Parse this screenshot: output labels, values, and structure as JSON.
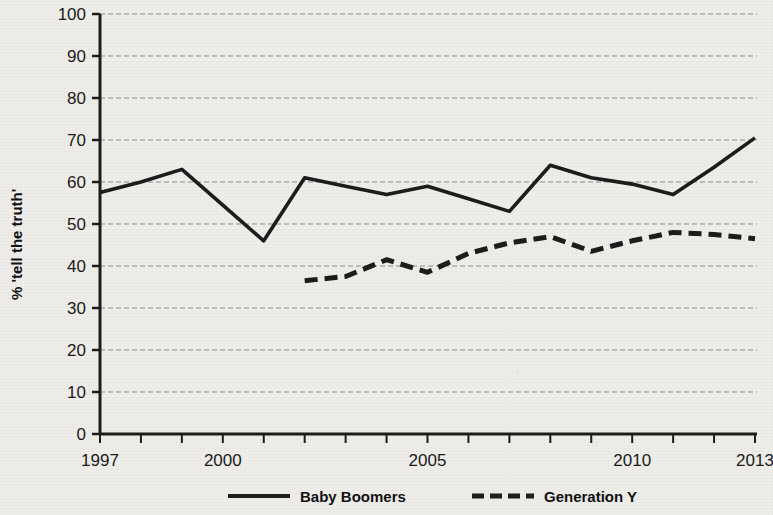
{
  "chart_data": {
    "type": "line",
    "title": "",
    "subtitle": "",
    "xlabel": "",
    "ylabel": "% 'tell the truth'",
    "xlim": [
      1997,
      2013
    ],
    "ylim": [
      0,
      100
    ],
    "ytick_values": [
      0,
      10,
      20,
      30,
      40,
      50,
      60,
      70,
      80,
      90,
      100
    ],
    "ytick_labels": [
      "0",
      "10",
      "20",
      "30",
      "40",
      "50",
      "60",
      "70",
      "80",
      "90",
      "100"
    ],
    "xtick_values": [
      1997,
      1998,
      1999,
      2000,
      2001,
      2002,
      2003,
      2004,
      2005,
      2006,
      2007,
      2008,
      2009,
      2010,
      2011,
      2012,
      2013
    ],
    "xtick_labels_shown": [
      "1997",
      "2000",
      "2005",
      "2010",
      "2013"
    ],
    "xtick_labeled_values": [
      1997,
      2000,
      2005,
      2010,
      2013
    ],
    "grid": "horizontal-dashed",
    "legend_position": "bottom",
    "series": [
      {
        "name": "Baby Boomers",
        "style": "solid",
        "color": "#1c1c1c",
        "x": [
          1997,
          1998,
          1999,
          2000,
          2001,
          2002,
          2003,
          2004,
          2005,
          2006,
          2007,
          2008,
          2009,
          2010,
          2011,
          2012,
          2013
        ],
        "values": [
          57.5,
          60,
          63,
          54.5,
          46,
          61,
          59,
          57,
          59,
          56,
          53,
          64,
          61,
          59.5,
          57,
          63.5,
          70.5
        ]
      },
      {
        "name": "Generation Y",
        "style": "dashed",
        "color": "#1c1c1c",
        "x": [
          2002,
          2003,
          2004,
          2005,
          2006,
          2007,
          2008,
          2009,
          2010,
          2011,
          2012,
          2013
        ],
        "values": [
          36.5,
          37.5,
          41.5,
          38.5,
          43,
          45.5,
          47,
          43.5,
          46,
          48,
          47.5,
          46.5
        ]
      }
    ]
  },
  "axes": {
    "y_title": "% 'tell the truth'"
  },
  "legend": {
    "items": [
      {
        "label": "Baby Boomers",
        "style": "solid"
      },
      {
        "label": "Generation Y",
        "style": "dashed"
      }
    ]
  }
}
